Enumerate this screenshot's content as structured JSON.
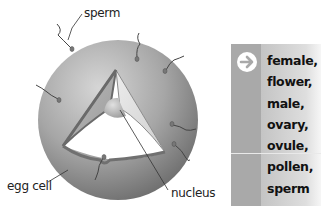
{
  "diagram": {
    "labels": {
      "sperm": "sperm",
      "egg_cell": "egg cell",
      "nucleus": "nucleus"
    }
  },
  "word_box": {
    "icon": "arrow-right-circle-icon",
    "words": [
      "female,",
      "flower,",
      "male,",
      "ovary,",
      "ovule,",
      "pollen,",
      "sperm"
    ]
  }
}
